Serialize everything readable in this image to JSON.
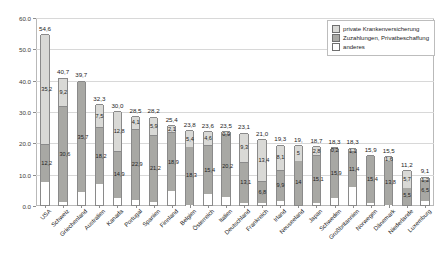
{
  "chart_data": {
    "type": "bar",
    "title": "",
    "xlabel": "",
    "ylabel": "",
    "ylim": [
      0,
      60
    ],
    "grid": true,
    "stacked": true,
    "legend_position": "top-right",
    "ytick_labels": [
      "0.0",
      "10.0",
      "20.0",
      "30.0",
      "40.0",
      "50.0",
      "60.0"
    ],
    "ytick_values": [
      0,
      10,
      20,
      30,
      40,
      50,
      60
    ],
    "categories": [
      "USA",
      "Schweiz",
      "Griechenland",
      "Australien",
      "Kanada",
      "Portugal",
      "Spanien",
      "Finnland",
      "Belgien",
      "Österreich",
      "Italien",
      "Deutschland",
      "Frankreich",
      "Irland",
      "Neuseeland",
      "Japan",
      "Schweden",
      "Großbritannien",
      "Norwegen",
      "Dänemark",
      "Niederlande",
      "Luxemburg"
    ],
    "totals": [
      54.6,
      40.7,
      39.7,
      32.3,
      30.0,
      28.5,
      28.2,
      25.4,
      23.8,
      23.6,
      23.5,
      23.1,
      21.0,
      19.3,
      19.0,
      18.7,
      18.3,
      18.3,
      15.9,
      15.5,
      11.2,
      9.1
    ],
    "series": [
      {
        "name": "private Krankenversicherung",
        "color": "#d9d9d6",
        "values": [
          35.2,
          9.2,
          0.0,
          7.5,
          12.8,
          4.1,
          5.9,
          2.1,
          5.4,
          4.6,
          0.9,
          9.3,
          13.4,
          8.1,
          5.0,
          2.8,
          0.2,
          1.1,
          0.0,
          1.6,
          5.7,
          1.2
        ]
      },
      {
        "name": "Zuzahlungen, Privatbeschaffung",
        "color": "#a8a8a4",
        "values": [
          12.2,
          30.6,
          35.7,
          18.2,
          14.9,
          22.9,
          21.2,
          18.9,
          18.3,
          15.4,
          20.2,
          13.1,
          6.8,
          9.9,
          14.0,
          15.1,
          15.9,
          11.4,
          15.4,
          13.8,
          5.5,
          6.5
        ]
      },
      {
        "name": "anderes",
        "color": "#ffffff",
        "values": [
          7.2,
          0.9,
          4.0,
          6.6,
          2.3,
          1.5,
          1.1,
          4.4,
          0.1,
          3.6,
          2.4,
          0.7,
          0.8,
          1.3,
          0.0,
          0.8,
          2.2,
          5.8,
          0.5,
          0.1,
          0.0,
          1.4
        ]
      }
    ],
    "segment_labels": {
      "private Krankenversicherung": [
        "35,2",
        "9,2",
        "",
        "7,5",
        "12,8",
        "4,1",
        "5,9",
        "2,1",
        "5,4",
        "4,6",
        "0,9",
        "9,3",
        "13,4",
        "8,1",
        "5",
        "2,8",
        "0,2",
        "1,1",
        "",
        "1,6",
        "5,7",
        "1,2"
      ],
      "Zuzahlungen, Privatbeschaffung": [
        "12,2",
        "30,6",
        "35,7",
        "18,2",
        "14,9",
        "22,9",
        "21,2",
        "18,9",
        "18,3",
        "15,4",
        "20,2",
        "13,1",
        "6,8",
        "9,9",
        "14",
        "15,1",
        "15,9",
        "11,4",
        "15,4",
        "13,8",
        "5,5",
        "6,5"
      ]
    },
    "total_labels": [
      "54,6",
      "40,7",
      "39,7",
      "32,3",
      "30,0",
      "28,5",
      "28,2",
      "25,4",
      "23,8",
      "23,6",
      "23,5",
      "23,1",
      "21,0",
      "19,3",
      "19,",
      "18,7",
      "18,3",
      "18,3",
      "15,9",
      "15,5",
      "11,2",
      "9,1"
    ]
  },
  "legend": {
    "items": [
      {
        "label": "private Krankenversicherung",
        "swatch": "sw-priv"
      },
      {
        "label": "Zuzahlungen, Privatbeschaffung",
        "swatch": "sw-zuz"
      },
      {
        "label": "anderes",
        "swatch": "sw-and"
      }
    ]
  }
}
